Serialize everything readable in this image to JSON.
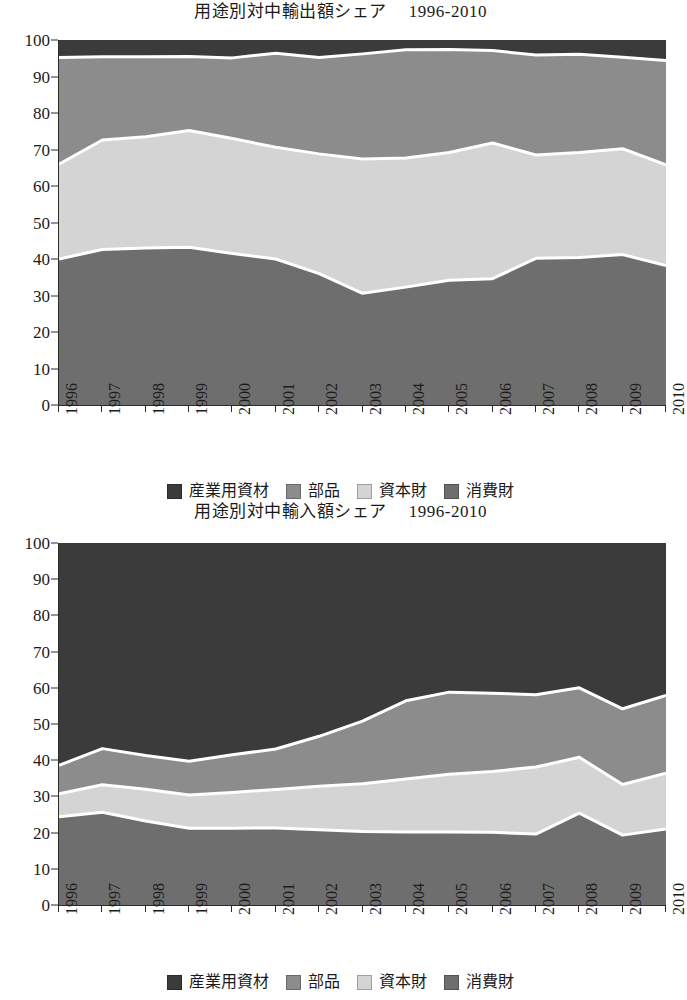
{
  "charts": [
    {
      "title": "用途別対中輸出額シェア　 1996-2010",
      "chart_name": "export-share-chart"
    },
    {
      "title": "用途別対中輸入額シェア　 1996-2010",
      "chart_name": "import-share-chart"
    }
  ],
  "legend": {
    "items": [
      {
        "label": "産業用資材",
        "color": "#3b3b3b"
      },
      {
        "label": "部品",
        "color": "#8c8c8c"
      },
      {
        "label": "資本財",
        "color": "#d4d4d4"
      },
      {
        "label": "消費財",
        "color": "#6e6e6e"
      }
    ]
  },
  "axis": {
    "yticks": [
      "100",
      "90",
      "80",
      "70",
      "60",
      "50",
      "40",
      "30",
      "20",
      "10",
      "0"
    ],
    "ylim": [
      0,
      100
    ],
    "xticks": [
      "1996",
      "1997",
      "1998",
      "1999",
      "2000",
      "2001",
      "2002",
      "2003",
      "2004",
      "2005",
      "2006",
      "2007",
      "2008",
      "2009",
      "2010"
    ]
  },
  "colors": {
    "industrial_supplies": "#3b3b3b",
    "parts": "#8c8c8c",
    "capital_goods": "#d4d4d4",
    "consumer_goods": "#6e6e6e",
    "separator": "#ffffff",
    "axis": "#2b2b2b"
  },
  "chart_data": [
    {
      "type": "area",
      "stacked": true,
      "normalized": true,
      "title": "用途別対中輸出額シェア　 1996-2010",
      "xlabel": "",
      "ylabel": "",
      "ylim": [
        0,
        100
      ],
      "grid": false,
      "legend_position": "bottom",
      "x": [
        "1996",
        "1997",
        "1998",
        "1999",
        "2000",
        "2001",
        "2002",
        "2003",
        "2004",
        "2005",
        "2006",
        "2007",
        "2008",
        "2009",
        "2010"
      ],
      "series": [
        {
          "name": "消費財",
          "stack_order": 1,
          "values": [
            40.0,
            42.6,
            43.0,
            43.2,
            41.5,
            40.0,
            36.0,
            30.6,
            32.3,
            34.2,
            34.6,
            40.2,
            40.4,
            41.2,
            38.2
          ]
        },
        {
          "name": "資本財",
          "stack_order": 2,
          "values": [
            26.0,
            30.0,
            30.5,
            32.0,
            31.5,
            30.6,
            32.8,
            36.8,
            35.4,
            35.0,
            37.2,
            28.3,
            28.8,
            29.0,
            27.6
          ]
        },
        {
          "name": "部品",
          "stack_order": 3,
          "values": [
            29.2,
            22.8,
            21.9,
            20.3,
            22.1,
            25.8,
            26.4,
            28.8,
            29.6,
            28.2,
            25.3,
            27.4,
            26.9,
            25.1,
            28.6
          ]
        },
        {
          "name": "産業用資材",
          "stack_order": 4,
          "values": [
            4.8,
            4.6,
            4.6,
            4.5,
            4.9,
            3.6,
            4.8,
            3.8,
            2.7,
            2.6,
            2.9,
            4.1,
            3.9,
            4.7,
            5.6
          ]
        }
      ],
      "boundaries_cumulative": {
        "b1_consumer_top": [
          40.0,
          42.6,
          43.0,
          43.2,
          41.5,
          40.0,
          36.0,
          30.6,
          32.3,
          34.2,
          34.6,
          40.2,
          40.4,
          41.2,
          38.2
        ],
        "b2_capital_top": [
          66.0,
          72.6,
          73.5,
          75.2,
          73.0,
          70.6,
          68.8,
          67.4,
          67.7,
          69.2,
          71.8,
          68.5,
          69.2,
          70.2,
          65.8
        ],
        "b3_parts_top": [
          95.2,
          95.4,
          95.4,
          95.5,
          95.1,
          96.4,
          95.2,
          96.2,
          97.3,
          97.4,
          97.1,
          95.9,
          96.1,
          95.3,
          94.4
        ]
      }
    },
    {
      "type": "area",
      "stacked": true,
      "normalized": true,
      "title": "用途別対中輸入額シェア　 1996-2010",
      "xlabel": "",
      "ylabel": "",
      "ylim": [
        0,
        100
      ],
      "grid": false,
      "legend_position": "bottom",
      "x": [
        "1996",
        "1997",
        "1998",
        "1999",
        "2000",
        "2001",
        "2002",
        "2003",
        "2004",
        "2005",
        "2006",
        "2007",
        "2008",
        "2009",
        "2010"
      ],
      "series": [
        {
          "name": "消費財",
          "stack_order": 1,
          "values": [
            24.4,
            25.6,
            23.2,
            21.2,
            21.2,
            21.3,
            20.8,
            20.3,
            20.2,
            20.2,
            20.1,
            19.6,
            25.4,
            19.3,
            21.0
          ]
        },
        {
          "name": "資本財",
          "stack_order": 2,
          "values": [
            6.3,
            7.6,
            8.8,
            9.2,
            9.9,
            10.6,
            12.0,
            13.2,
            14.6,
            15.9,
            16.8,
            18.5,
            15.4,
            14.0,
            15.4
          ]
        },
        {
          "name": "部品",
          "stack_order": 3,
          "values": [
            7.9,
            10.0,
            9.3,
            9.3,
            10.4,
            11.2,
            13.8,
            17.3,
            21.6,
            22.7,
            21.6,
            20.0,
            19.2,
            20.9,
            21.5
          ]
        },
        {
          "name": "産業用資材",
          "stack_order": 4,
          "values": [
            61.4,
            56.8,
            58.7,
            60.3,
            58.5,
            56.9,
            53.4,
            49.2,
            43.6,
            41.2,
            41.5,
            41.9,
            40.0,
            45.8,
            42.1
          ]
        }
      ],
      "boundaries_cumulative": {
        "b1_consumer_top": [
          24.4,
          25.6,
          23.2,
          21.2,
          21.2,
          21.3,
          20.8,
          20.3,
          20.2,
          20.2,
          20.1,
          19.6,
          25.4,
          19.3,
          21.0
        ],
        "b2_capital_top": [
          30.7,
          33.2,
          32.0,
          30.4,
          31.1,
          31.9,
          32.8,
          33.5,
          34.8,
          36.1,
          36.9,
          38.1,
          40.8,
          33.3,
          36.4
        ],
        "b3_parts_top": [
          38.6,
          43.2,
          41.3,
          39.7,
          41.5,
          43.1,
          46.6,
          50.8,
          56.4,
          58.8,
          58.5,
          58.1,
          60.0,
          54.2,
          57.9
        ]
      }
    }
  ]
}
